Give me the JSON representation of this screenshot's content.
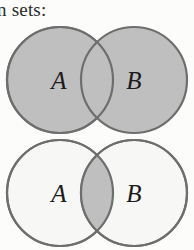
{
  "page": {
    "width": 194,
    "height": 250,
    "background_color": "#fcfcfa",
    "caption_fragment": "n sets:"
  },
  "palette": {
    "shaded_fill": "#bfbfbf",
    "unshaded_fill": "#f7f7f5",
    "stroke": "#6e6e6e",
    "label_color": "#1c1c1c",
    "text_color": "#2b2b2b"
  },
  "diagrams": [
    {
      "name": "venn-union",
      "title": "A union B",
      "shaded_region": "both-circles",
      "left_label": "A",
      "right_label": "B",
      "circle_radius": 54,
      "left_center_x": 60,
      "right_center_x": 134,
      "center_y": 55
    },
    {
      "name": "venn-intersection",
      "title": "A intersect B",
      "shaded_region": "overlap-only",
      "left_label": "A",
      "right_label": "B",
      "circle_radius": 54,
      "left_center_x": 60,
      "right_center_x": 134,
      "center_y": 55
    }
  ]
}
